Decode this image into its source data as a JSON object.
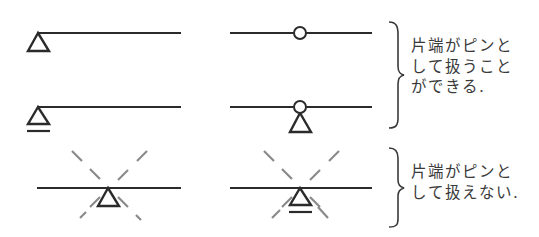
{
  "diagram": {
    "type": "structural-support-comparison",
    "colors": {
      "stroke": "#2b2b2b",
      "dashed": "#8a8a8a",
      "text": "#3a3a3a",
      "background": "#ffffff"
    },
    "rows": [
      {
        "left": {
          "element": "beam",
          "support": "pin",
          "support_position": "end"
        },
        "right": {
          "element": "beam",
          "joint": "hinge",
          "support": "none"
        }
      },
      {
        "left": {
          "element": "beam",
          "support": "roller",
          "support_position": "end"
        },
        "right": {
          "element": "beam",
          "joint": "hinge",
          "support": "pin"
        }
      },
      {
        "left": {
          "element": "beam",
          "support": "pin",
          "support_position": "middle",
          "crossed_out": true
        },
        "right": {
          "element": "beam",
          "support": "roller",
          "support_position": "middle",
          "crossed_out": true
        }
      }
    ],
    "notes": [
      {
        "id": "can",
        "lines": [
          "片端がピンと",
          "して扱うこと",
          "ができる."
        ],
        "applies_to_rows": [
          0,
          1
        ]
      },
      {
        "id": "cannot",
        "lines": [
          "片端がピンと",
          "して扱えない."
        ],
        "applies_to_rows": [
          2
        ]
      }
    ]
  }
}
